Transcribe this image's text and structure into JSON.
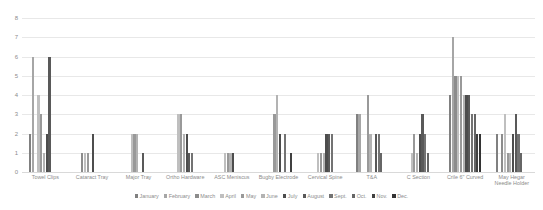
{
  "chart_data": {
    "type": "bar",
    "title": "",
    "xlabel": "",
    "ylabel": "",
    "ylim": [
      0,
      8
    ],
    "yticks": [
      0,
      1,
      2,
      3,
      4,
      5,
      6,
      7,
      8
    ],
    "grid": true,
    "legend_position": "bottom",
    "categories": [
      "Towel Clips",
      "Cataract Tray",
      "Major Tray",
      "Ortho Hardware",
      "ASC Meniscus",
      "Bugby Electrode",
      "Cervical Spine",
      "T&A",
      "C Section",
      "Crile 6\" Curved",
      "May Hegar Needle Holder"
    ],
    "series": [
      {
        "name": "January",
        "color": "#808080",
        "values": [
          2,
          0,
          0,
          0,
          0,
          0,
          0,
          3,
          0,
          4,
          2
        ]
      },
      {
        "name": "February",
        "color": "#a6a6a6",
        "values": [
          6,
          0,
          0,
          0,
          0,
          0,
          0,
          3,
          0,
          7,
          0
        ]
      },
      {
        "name": "March",
        "color": "#8c8c8c",
        "values": [
          0,
          1,
          0,
          0,
          0,
          0,
          0,
          0,
          0,
          5,
          2
        ]
      },
      {
        "name": "April",
        "color": "#bfbfbf",
        "values": [
          4,
          1,
          2,
          3,
          1,
          0,
          1,
          0,
          1,
          5,
          3
        ]
      },
      {
        "name": "May",
        "color": "#999999",
        "values": [
          3,
          1,
          2,
          3,
          1,
          3,
          1,
          4,
          2,
          5,
          1
        ]
      },
      {
        "name": "June",
        "color": "#b3b3b3",
        "values": [
          1,
          0,
          2,
          2,
          1,
          4,
          1,
          2,
          1,
          4,
          1
        ]
      },
      {
        "name": "July",
        "color": "#4d4d4d",
        "values": [
          2,
          2,
          0,
          2,
          1,
          2,
          2,
          0,
          2,
          4,
          2
        ]
      },
      {
        "name": "August",
        "color": "#595959",
        "values": [
          6,
          0,
          1,
          1,
          0,
          0,
          2,
          2,
          3,
          4,
          3
        ]
      },
      {
        "name": "Sept.",
        "color": "#737373",
        "values": [
          0,
          0,
          0,
          1,
          0,
          2,
          2,
          2,
          2,
          3,
          2
        ]
      },
      {
        "name": "Oct.",
        "color": "#666666",
        "values": [
          0,
          0,
          0,
          0,
          0,
          0,
          0,
          1,
          1,
          3,
          1
        ]
      },
      {
        "name": "Nov.",
        "color": "#404040",
        "values": [
          0,
          0,
          0,
          0,
          0,
          1,
          0,
          0,
          0,
          2,
          0
        ]
      },
      {
        "name": "Dec.",
        "color": "#333333",
        "values": [
          0,
          0,
          0,
          0,
          0,
          0,
          0,
          0,
          0,
          2,
          0
        ]
      }
    ]
  }
}
